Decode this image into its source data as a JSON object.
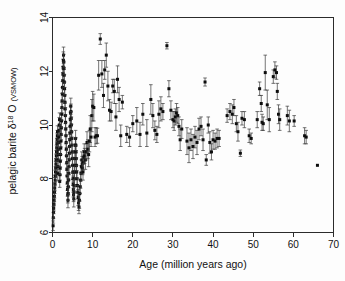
{
  "figure": {
    "background_color": "#fdfdfd",
    "marker_color": "#0d0d0d",
    "error_bar_color": "#3a3a3a",
    "axis_color": "#2b2b2b"
  },
  "chart_data": {
    "type": "scatter",
    "title": "",
    "xlabel": "Age (million years ago)",
    "ylabel_prefix": "pelagic barite ",
    "ylabel_delta": "δ",
    "ylabel_sup": "18",
    "ylabel_mid": " O ",
    "ylabel_unit": "(VSMOW)",
    "ylabel_full": "pelagic barite δ18 O (VSMOW)",
    "xlim": [
      0,
      70
    ],
    "ylim": [
      6,
      14
    ],
    "xticks": [
      0,
      10,
      20,
      30,
      40,
      50,
      60,
      70
    ],
    "yticks": [
      6,
      8,
      10,
      12,
      14
    ],
    "xtick_labels": [
      "0",
      "10",
      "20",
      "30",
      "40",
      "50",
      "60",
      "70"
    ],
    "ytick_labels": [
      "6",
      "8",
      "10",
      "12",
      "14"
    ],
    "grid": false,
    "legend": "none",
    "marker_style": "square",
    "error_bars": "vertical",
    "series": [
      {
        "name": "pelagic barite oxygen isotope measurements",
        "points": [
          [
            0.15,
            6.25,
            0.18
          ],
          [
            0.2,
            6.55,
            0.2
          ],
          [
            0.25,
            6.75,
            0.22
          ],
          [
            0.3,
            6.9,
            0.2
          ],
          [
            0.35,
            7.05,
            0.25
          ],
          [
            0.4,
            7.2,
            0.18
          ],
          [
            0.45,
            7.35,
            0.2
          ],
          [
            0.5,
            7.5,
            0.22
          ],
          [
            0.55,
            7.65,
            0.2
          ],
          [
            0.6,
            7.8,
            0.25
          ],
          [
            0.65,
            7.95,
            0.18
          ],
          [
            0.7,
            8.1,
            0.22
          ],
          [
            0.75,
            8.25,
            0.2
          ],
          [
            0.8,
            8.4,
            0.25
          ],
          [
            0.85,
            8.55,
            0.2
          ],
          [
            0.9,
            8.7,
            0.22
          ],
          [
            0.95,
            8.85,
            0.2
          ],
          [
            1.0,
            9.0,
            0.25
          ],
          [
            1.05,
            9.15,
            0.22
          ],
          [
            1.1,
            9.3,
            0.2
          ],
          [
            1.15,
            9.45,
            0.25
          ],
          [
            1.2,
            9.6,
            0.2
          ],
          [
            1.25,
            9.75,
            0.22
          ],
          [
            1.3,
            8.2,
            0.28
          ],
          [
            1.35,
            8.45,
            0.2
          ],
          [
            1.4,
            8.7,
            0.25
          ],
          [
            1.45,
            8.9,
            0.22
          ],
          [
            1.5,
            9.1,
            0.2
          ],
          [
            1.55,
            9.35,
            0.25
          ],
          [
            1.6,
            9.55,
            0.22
          ],
          [
            1.65,
            9.8,
            0.2
          ],
          [
            1.7,
            10.0,
            0.28
          ],
          [
            1.75,
            10.2,
            0.25
          ],
          [
            1.8,
            7.9,
            0.22
          ],
          [
            1.85,
            8.15,
            0.2
          ],
          [
            1.9,
            8.4,
            0.25
          ],
          [
            1.95,
            8.65,
            0.22
          ],
          [
            2.0,
            8.9,
            0.2
          ],
          [
            2.05,
            9.15,
            0.25
          ],
          [
            2.1,
            9.4,
            0.22
          ],
          [
            2.15,
            9.65,
            0.2
          ],
          [
            2.2,
            9.9,
            0.28
          ],
          [
            2.25,
            10.15,
            0.25
          ],
          [
            2.3,
            10.4,
            0.22
          ],
          [
            2.35,
            10.65,
            0.2
          ],
          [
            2.4,
            10.9,
            0.28
          ],
          [
            2.45,
            11.15,
            0.25
          ],
          [
            2.5,
            11.4,
            0.22
          ],
          [
            2.55,
            11.65,
            0.3
          ],
          [
            2.6,
            11.9,
            0.28
          ],
          [
            2.65,
            12.15,
            0.3
          ],
          [
            2.7,
            12.4,
            0.32
          ],
          [
            2.75,
            12.6,
            0.3
          ],
          [
            2.8,
            12.35,
            0.28
          ],
          [
            2.85,
            12.1,
            0.25
          ],
          [
            2.9,
            11.85,
            0.3
          ],
          [
            2.95,
            11.6,
            0.28
          ],
          [
            3.0,
            11.35,
            0.25
          ],
          [
            3.05,
            11.1,
            0.3
          ],
          [
            3.1,
            10.85,
            0.28
          ],
          [
            3.15,
            10.6,
            0.25
          ],
          [
            3.2,
            10.35,
            0.3
          ],
          [
            3.25,
            10.1,
            0.28
          ],
          [
            3.3,
            9.85,
            0.25
          ],
          [
            3.35,
            9.6,
            0.3
          ],
          [
            3.4,
            9.35,
            0.28
          ],
          [
            3.45,
            9.1,
            0.25
          ],
          [
            3.5,
            8.85,
            0.3
          ],
          [
            3.55,
            8.6,
            0.28
          ],
          [
            3.6,
            8.35,
            0.25
          ],
          [
            3.65,
            8.1,
            0.3
          ],
          [
            3.7,
            7.85,
            0.28
          ],
          [
            3.75,
            7.6,
            0.25
          ],
          [
            3.8,
            7.4,
            0.3
          ],
          [
            3.85,
            7.2,
            0.28
          ],
          [
            3.9,
            7.45,
            0.25
          ],
          [
            3.95,
            7.7,
            0.3
          ],
          [
            4.0,
            7.95,
            0.28
          ],
          [
            4.05,
            8.2,
            0.25
          ],
          [
            4.1,
            8.45,
            0.3
          ],
          [
            4.15,
            8.7,
            0.28
          ],
          [
            4.2,
            8.95,
            0.25
          ],
          [
            4.25,
            9.2,
            0.3
          ],
          [
            4.3,
            9.45,
            0.28
          ],
          [
            4.35,
            9.7,
            0.25
          ],
          [
            4.4,
            9.95,
            0.3
          ],
          [
            4.45,
            10.2,
            0.28
          ],
          [
            4.5,
            10.45,
            0.25
          ],
          [
            4.55,
            10.7,
            0.3
          ],
          [
            4.6,
            10.5,
            0.28
          ],
          [
            4.65,
            10.25,
            0.25
          ],
          [
            4.7,
            10.0,
            0.3
          ],
          [
            4.75,
            9.75,
            0.28
          ],
          [
            4.8,
            9.5,
            0.25
          ],
          [
            4.85,
            9.25,
            0.3
          ],
          [
            4.9,
            9.0,
            0.28
          ],
          [
            4.95,
            8.75,
            0.25
          ],
          [
            5.0,
            8.5,
            0.3
          ],
          [
            5.05,
            8.25,
            0.28
          ],
          [
            5.1,
            8.0,
            0.25
          ],
          [
            5.15,
            7.8,
            0.3
          ],
          [
            5.2,
            7.6,
            0.28
          ],
          [
            5.25,
            7.4,
            0.25
          ],
          [
            5.3,
            7.25,
            0.3
          ],
          [
            5.35,
            7.5,
            0.28
          ],
          [
            5.4,
            7.75,
            0.25
          ],
          [
            5.45,
            8.0,
            0.3
          ],
          [
            5.5,
            8.25,
            0.28
          ],
          [
            5.55,
            8.5,
            0.25
          ],
          [
            5.6,
            8.75,
            0.3
          ],
          [
            5.65,
            9.0,
            0.28
          ],
          [
            5.7,
            9.25,
            0.25
          ],
          [
            5.75,
            9.5,
            0.3
          ],
          [
            5.8,
            9.25,
            0.28
          ],
          [
            5.85,
            9.0,
            0.25
          ],
          [
            5.9,
            8.75,
            0.3
          ],
          [
            5.95,
            8.5,
            0.28
          ],
          [
            6.0,
            8.25,
            0.25
          ],
          [
            6.1,
            8.0,
            0.3
          ],
          [
            6.2,
            7.75,
            0.28
          ],
          [
            6.3,
            7.5,
            0.25
          ],
          [
            6.4,
            7.3,
            0.3
          ],
          [
            6.5,
            7.1,
            0.28
          ],
          [
            6.6,
            6.95,
            0.25
          ],
          [
            6.7,
            7.2,
            0.3
          ],
          [
            6.8,
            7.45,
            0.28
          ],
          [
            6.9,
            7.7,
            0.25
          ],
          [
            7.0,
            7.95,
            0.3
          ],
          [
            7.1,
            8.2,
            0.28
          ],
          [
            7.2,
            8.45,
            0.25
          ],
          [
            7.3,
            8.7,
            0.3
          ],
          [
            7.4,
            8.55,
            0.28
          ],
          [
            7.5,
            8.4,
            0.25
          ],
          [
            7.6,
            8.25,
            0.3
          ],
          [
            7.7,
            8.6,
            0.28
          ],
          [
            7.8,
            8.8,
            0.25
          ],
          [
            7.9,
            9.0,
            0.3
          ],
          [
            8.0,
            8.85,
            0.28
          ],
          [
            8.2,
            8.7,
            0.35
          ],
          [
            8.4,
            9.0,
            0.3
          ],
          [
            8.6,
            9.35,
            0.4
          ],
          [
            8.8,
            9.1,
            0.35
          ],
          [
            9.0,
            8.9,
            0.45
          ],
          [
            9.2,
            9.4,
            0.4
          ],
          [
            9.4,
            9.85,
            0.5
          ],
          [
            9.6,
            9.55,
            0.35
          ],
          [
            9.8,
            10.35,
            0.6
          ],
          [
            10.0,
            10.7,
            0.55
          ],
          [
            10.3,
            10.65,
            0.5
          ],
          [
            10.6,
            9.55,
            0.35
          ],
          [
            10.9,
            9.6,
            0.3
          ],
          [
            11.2,
            9.6,
            0.28
          ],
          [
            11.5,
            11.85,
            0.55
          ],
          [
            11.9,
            13.2,
            0.2
          ],
          [
            12.3,
            11.9,
            0.5
          ],
          [
            12.7,
            11.1,
            0.45
          ],
          [
            13.0,
            12.05,
            0.35
          ],
          [
            13.4,
            12.6,
            0.45
          ],
          [
            13.8,
            11.45,
            0.55
          ],
          [
            14.2,
            10.55,
            0.4
          ],
          [
            14.6,
            10.5,
            0.35
          ],
          [
            15.0,
            11.45,
            0.25
          ],
          [
            15.4,
            11.25,
            0.45
          ],
          [
            15.8,
            10.3,
            0.5
          ],
          [
            16.2,
            11.7,
            0.5
          ],
          [
            16.6,
            10.95,
            0.45
          ],
          [
            17.0,
            9.6,
            0.4
          ],
          [
            17.4,
            10.85,
            0.25
          ],
          [
            18.5,
            9.65,
            0.3
          ],
          [
            19.2,
            9.55,
            0.35
          ],
          [
            20.0,
            10.05,
            0.3
          ],
          [
            21.0,
            10.15,
            0.5
          ],
          [
            21.8,
            9.65,
            0.45
          ],
          [
            22.5,
            10.4,
            0.4
          ],
          [
            23.5,
            9.7,
            0.5
          ],
          [
            24.5,
            10.95,
            0.55
          ],
          [
            25.0,
            10.35,
            0.45
          ],
          [
            25.5,
            9.8,
            0.35
          ],
          [
            26.0,
            9.65,
            0.3
          ],
          [
            26.5,
            10.4,
            0.5
          ],
          [
            27.0,
            10.6,
            0.45
          ],
          [
            27.5,
            10.5,
            0.3
          ],
          [
            28.5,
            12.95,
            0.12
          ],
          [
            29.0,
            11.35,
            0.3
          ],
          [
            29.5,
            10.55,
            0.35
          ],
          [
            30.0,
            10.2,
            0.3
          ],
          [
            30.3,
            10.15,
            0.35
          ],
          [
            30.6,
            10.3,
            0.3
          ],
          [
            30.9,
            10.45,
            0.35
          ],
          [
            31.2,
            10.35,
            0.3
          ],
          [
            31.5,
            9.95,
            0.35
          ],
          [
            31.8,
            9.45,
            0.4
          ],
          [
            32.2,
            9.85,
            0.35
          ],
          [
            33.5,
            9.4,
            0.5
          ],
          [
            34.0,
            9.15,
            0.55
          ],
          [
            34.5,
            9.45,
            0.4
          ],
          [
            35.0,
            9.2,
            0.45
          ],
          [
            35.5,
            9.55,
            0.4
          ],
          [
            36.0,
            9.35,
            0.45
          ],
          [
            36.5,
            9.85,
            0.4
          ],
          [
            37.0,
            9.95,
            0.35
          ],
          [
            37.5,
            9.45,
            0.4
          ],
          [
            38.0,
            11.6,
            0.15
          ],
          [
            38.3,
            8.7,
            0.2
          ],
          [
            38.8,
            10.0,
            0.3
          ],
          [
            39.2,
            9.35,
            0.4
          ],
          [
            39.6,
            9.0,
            0.3
          ],
          [
            40.0,
            9.45,
            0.35
          ],
          [
            40.5,
            9.4,
            0.3
          ],
          [
            41.0,
            9.5,
            0.35
          ],
          [
            41.5,
            9.5,
            0.3
          ],
          [
            43.5,
            10.35,
            0.25
          ],
          [
            44.2,
            10.5,
            0.3
          ],
          [
            44.8,
            10.4,
            0.35
          ],
          [
            45.2,
            10.65,
            0.3
          ],
          [
            45.8,
            10.05,
            0.3
          ],
          [
            46.2,
            9.75,
            0.35
          ],
          [
            46.8,
            8.95,
            0.12
          ],
          [
            47.2,
            10.25,
            0.25
          ],
          [
            47.8,
            10.2,
            0.3
          ],
          [
            49.0,
            9.6,
            0.25
          ],
          [
            49.5,
            9.5,
            0.2
          ],
          [
            51.0,
            10.2,
            0.3
          ],
          [
            51.6,
            11.35,
            0.25
          ],
          [
            52.0,
            10.8,
            0.3
          ],
          [
            52.2,
            10.1,
            0.3
          ],
          [
            52.5,
            10.05,
            0.25
          ],
          [
            53.0,
            11.95,
            0.65
          ],
          [
            53.5,
            10.75,
            0.55
          ],
          [
            54.0,
            10.2,
            0.45
          ],
          [
            55.0,
            11.8,
            0.25
          ],
          [
            55.4,
            12.05,
            0.3
          ],
          [
            55.8,
            11.95,
            0.25
          ],
          [
            56.0,
            11.25,
            0.3
          ],
          [
            56.3,
            10.4,
            0.35
          ],
          [
            56.6,
            10.2,
            0.4
          ],
          [
            58.5,
            10.35,
            0.35
          ],
          [
            59.0,
            10.15,
            0.4
          ],
          [
            60.2,
            10.15,
            0.2
          ],
          [
            62.8,
            9.6,
            0.3
          ],
          [
            63.2,
            9.55,
            0.25
          ],
          [
            66.0,
            8.5,
            0.08
          ]
        ]
      }
    ]
  }
}
